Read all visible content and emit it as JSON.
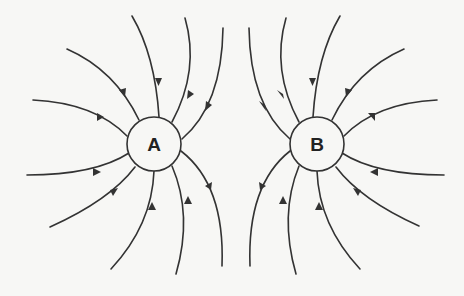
{
  "diagram": {
    "type": "electric field lines",
    "line_color": "#333333",
    "background": "#f7f7f5",
    "charges": [
      {
        "id": "A",
        "label": "A",
        "cx": 154,
        "cy": 144,
        "r": 27,
        "field_direction": "inward"
      },
      {
        "id": "B",
        "label": "B",
        "cx": 317,
        "cy": 144,
        "r": 27,
        "field_direction": "inward"
      }
    ],
    "field_line_count_per_charge": 12
  }
}
